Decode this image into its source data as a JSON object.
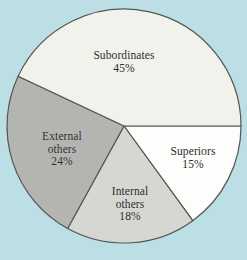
{
  "figure": {
    "background_color": "#bcdfe5",
    "caption_fragment": ""
  },
  "chart_data": {
    "type": "pie",
    "title": "",
    "xlabel": "",
    "ylabel": "",
    "legend_position": "none",
    "grid": false,
    "start_angle_deg": 0,
    "direction": "clockwise",
    "units": "percent",
    "categories": [
      "Superiors",
      "Internal others",
      "External others",
      "Subordinates"
    ],
    "values": [
      15,
      18,
      24,
      45
    ],
    "slices": [
      {
        "name": "Superiors",
        "label_lines": [
          "Superiors"
        ],
        "value": 15,
        "value_label": "15%",
        "color": "#fdfdfb",
        "start_deg": 0,
        "end_deg": 54
      },
      {
        "name": "Internal others",
        "label_lines": [
          "Internal",
          "others"
        ],
        "value": 18,
        "value_label": "18%",
        "color": "#d6d6d2",
        "start_deg": 54,
        "end_deg": 118.8
      },
      {
        "name": "External others",
        "label_lines": [
          "External",
          "others"
        ],
        "value": 24,
        "value_label": "24%",
        "color": "#b4b4b0",
        "start_deg": 118.8,
        "end_deg": 205.2
      },
      {
        "name": "Subordinates",
        "label_lines": [
          "Subordinates"
        ],
        "value": 45,
        "value_label": "45%",
        "color": "#f2f2ec",
        "start_deg": 205.2,
        "end_deg": 360
      }
    ],
    "outline_color": "#555553",
    "center": [
      124,
      126
    ],
    "radius": 117
  }
}
